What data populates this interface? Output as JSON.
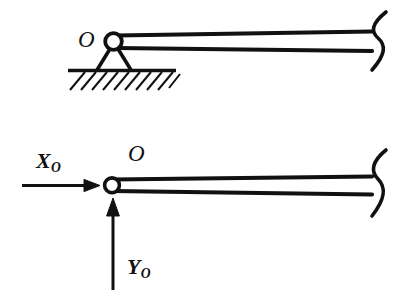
{
  "figure": {
    "kind": "engineering-statics-diagram",
    "background_color": "#ffffff",
    "ink_color": "#111111",
    "width": 408,
    "height": 299
  },
  "diagrams": {
    "upper": {
      "name": "pin-supported-beam",
      "support_type": "pin",
      "ground": "hatched",
      "beam_break": "s-curve",
      "point_label": "O"
    },
    "lower": {
      "name": "free-body-diagram",
      "beam_break": "s-curve",
      "point_label": "O",
      "forces": [
        {
          "symbol": "X",
          "subscript": "O",
          "direction": "horizontal-right",
          "name": "horizontal-reaction"
        },
        {
          "symbol": "Y",
          "subscript": "O",
          "direction": "vertical-up",
          "name": "vertical-reaction"
        }
      ]
    }
  },
  "labels": {
    "o_top": "O",
    "o_bottom": "O",
    "x_symbol": "X",
    "x_subscript": "O",
    "y_symbol": "Y",
    "y_subscript": "O"
  }
}
